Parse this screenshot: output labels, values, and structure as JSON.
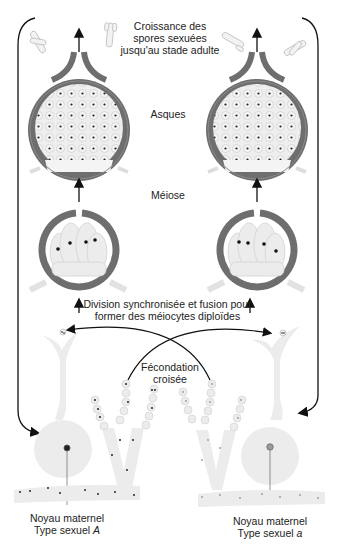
{
  "labels": {
    "growth_line1": "Croissance des",
    "growth_line2": "spores sexuées",
    "growth_line3": "jusqu'au stade adulte",
    "asci": "Asques",
    "meiosis": "Méiose",
    "division_line1": "Division synchronisée et fusion pour",
    "division_line2": "former des méiocytes diploïdes",
    "fertilization_line1": "Fécondation",
    "fertilization_line2": "croisée",
    "left_nucleus_line1": "Noyau maternel",
    "left_nucleus_line2_prefix": "Type sexuel ",
    "left_mating_type": "A",
    "right_nucleus_line1": "Noyau maternel",
    "right_nucleus_line2_prefix": "Type sexuel ",
    "right_mating_type": "a"
  },
  "colors": {
    "wall": "#6e6e6e",
    "cell_fill": "#ebebeb",
    "cell_stroke": "#cfcfcf",
    "dark_nucleus": "#111111",
    "light_nucleus": "#8a8a8a",
    "arrow": "#111111"
  }
}
